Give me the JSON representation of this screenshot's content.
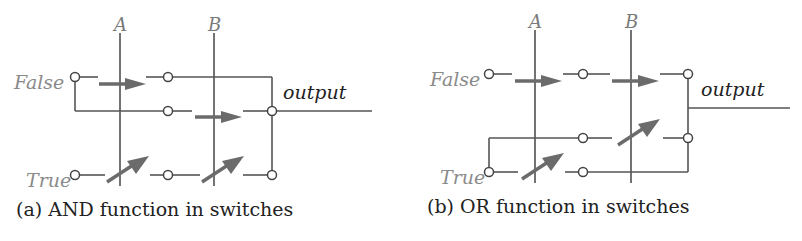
{
  "panels": [
    {
      "id": "a",
      "caption": "(a) AND function in switches",
      "labels": {
        "var_a": "A",
        "var_b": "B",
        "false": "False",
        "true": "True",
        "output": "output"
      },
      "function": "AND"
    },
    {
      "id": "b",
      "caption": "(b) OR function in switches",
      "labels": {
        "var_a": "A",
        "var_b": "B",
        "false": "False",
        "true": "True",
        "output": "output"
      },
      "function": "OR"
    }
  ],
  "colors": {
    "wire": "#555555",
    "arrow": "#6b6b6b",
    "label_gray": "#8a8a8a",
    "text": "#222222"
  }
}
